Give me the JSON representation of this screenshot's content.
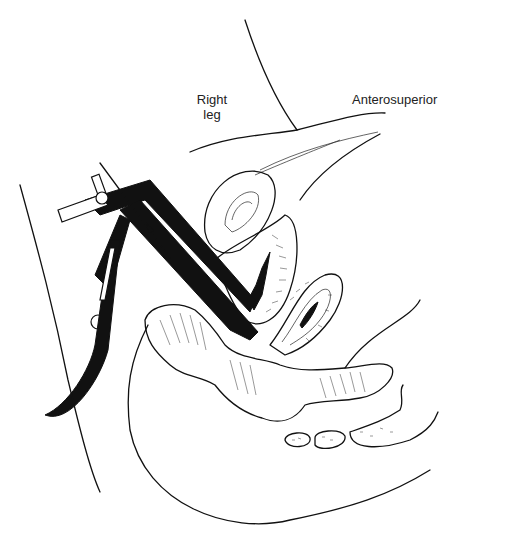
{
  "figure": {
    "type": "anatomical-line-drawing",
    "view": "sagittal section with speculum inserted",
    "labels": {
      "right_leg_line1": "Right",
      "right_leg_line2": "leg",
      "anterosuperior": "Anterosuperior"
    },
    "colors": {
      "ink": "#111111",
      "background": "#ffffff"
    }
  }
}
